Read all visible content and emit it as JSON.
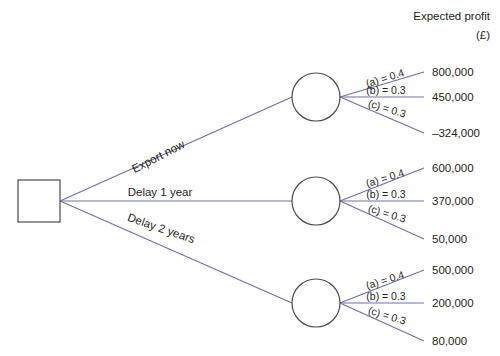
{
  "header": {
    "line1": "Expected profit",
    "line2": "(£)"
  },
  "decision_node": {
    "name": "decision-node",
    "x": 18,
    "y": 180,
    "size": 42
  },
  "branches": [
    {
      "id": "export-now",
      "label": "Export now",
      "rotation": -27.5,
      "label_x": 160,
      "label_y": 160,
      "node": {
        "cx": 316,
        "cy": 97,
        "r": 24
      },
      "outcomes": [
        {
          "prob_label": "(a) = 0.4",
          "prob_value": 0.4,
          "payoff": "800,000",
          "payoff_value": 800000,
          "end_y": 72,
          "rotation": -17
        },
        {
          "prob_label": "(b) = 0.3",
          "prob_value": 0.3,
          "payoff": "450,000",
          "payoff_value": 450000,
          "end_y": 97,
          "rotation": 0
        },
        {
          "prob_label": "(c) = 0.3",
          "prob_value": 0.3,
          "payoff": "–324,000",
          "payoff_value": -324000,
          "end_y": 133,
          "rotation": 17
        }
      ]
    },
    {
      "id": "delay-1-year",
      "label": "Delay 1 year",
      "rotation": 0,
      "label_x": 160,
      "label_y": 196,
      "node": {
        "cx": 316,
        "cy": 201,
        "r": 24
      },
      "outcomes": [
        {
          "prob_label": "(a) = 0.4",
          "prob_value": 0.4,
          "payoff": "600,000",
          "payoff_value": 600000,
          "end_y": 168,
          "rotation": -17
        },
        {
          "prob_label": "(b) = 0.3",
          "prob_value": 0.3,
          "payoff": "370,000",
          "payoff_value": 370000,
          "end_y": 201,
          "rotation": 0
        },
        {
          "prob_label": "(c) = 0.3",
          "prob_value": 0.3,
          "payoff": "50,000",
          "payoff_value": 50000,
          "end_y": 239,
          "rotation": 17
        }
      ]
    },
    {
      "id": "delay-2-years",
      "label": "Delay 2 years",
      "rotation": 19,
      "label_x": 160,
      "label_y": 232,
      "node": {
        "cx": 316,
        "cy": 303,
        "r": 24
      },
      "outcomes": [
        {
          "prob_label": "(a) = 0.4",
          "prob_value": 0.4,
          "payoff": "500,000",
          "payoff_value": 500000,
          "end_y": 270,
          "rotation": -17
        },
        {
          "prob_label": "(b) = 0.3",
          "prob_value": 0.3,
          "payoff": "200,000",
          "payoff_value": 200000,
          "end_y": 303,
          "rotation": 0
        },
        {
          "prob_label": "(c) = 0.3",
          "prob_value": 0.3,
          "payoff": "80,000",
          "payoff_value": 80000,
          "end_y": 341,
          "rotation": 17
        }
      ]
    }
  ],
  "colors": {
    "branch": "#6f6fae",
    "node_stroke": "#4a4a55",
    "text": "#231f20",
    "background": "#ffffff"
  },
  "geometry": {
    "payoff_x": 432,
    "branch_end_x": 424,
    "root_x": 60,
    "root_y": 201
  }
}
